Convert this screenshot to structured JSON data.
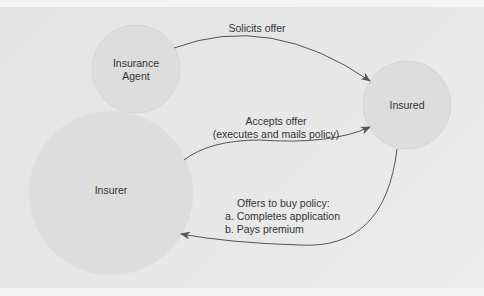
{
  "nodes": {
    "agent": {
      "line1": "Insurance",
      "line2": "Agent"
    },
    "insured": {
      "label": "Insured"
    },
    "insurer": {
      "label": "Insurer"
    }
  },
  "edges": {
    "solicits": {
      "label": "Solicits offer"
    },
    "accepts": {
      "line1": "Accepts offer",
      "line2": "(executes and mails policy)"
    },
    "offers": {
      "line1": "Offers to buy policy:",
      "line2": "a. Completes application",
      "line3": "b. Pays premium"
    }
  },
  "colors": {
    "background": "#e6e6e6",
    "node_fill": "#dcdcdc",
    "arrow": "#555555",
    "text": "#333333"
  }
}
